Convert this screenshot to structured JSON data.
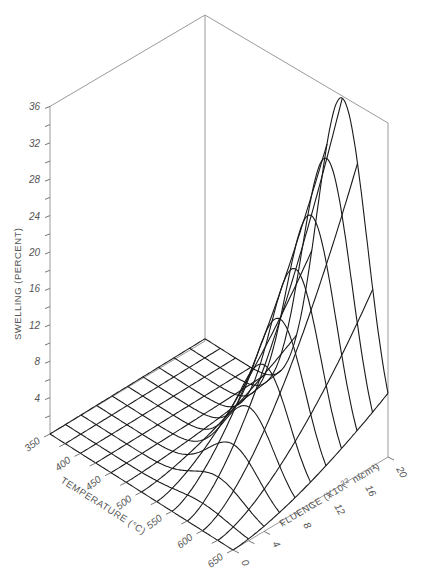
{
  "chart_data": {
    "type": "surface3d",
    "title": "",
    "zlabel": "SWELLING (PERCENT)",
    "xlabel": "TEMPERATURE (°C)",
    "ylabel": "FLUENCE (X10²² n/cm²)",
    "z_ticks": [
      4,
      8,
      12,
      16,
      20,
      24,
      28,
      32,
      36
    ],
    "z_range": [
      0,
      36
    ],
    "temperature_ticks": [
      350,
      400,
      450,
      500,
      550,
      600,
      650
    ],
    "temperature_range": [
      350,
      650
    ],
    "temperature_grid_step": 25,
    "fluence_ticks": [
      0,
      4,
      8,
      12,
      16,
      20
    ],
    "fluence_range": [
      0,
      20
    ],
    "fluence_grid_step": 2,
    "peak": {
      "temperature": 575,
      "fluence": 20,
      "swelling": 36
    },
    "model": {
      "peak_temperature": 575,
      "sigma": 58,
      "fluence_exponent": 1.6,
      "max_swelling": 36,
      "baseline": 0.25
    },
    "peak_swelling_by_fluence": {
      "fluence": [
        0,
        2,
        4,
        6,
        8,
        10,
        12,
        14,
        16,
        18,
        20
      ],
      "swelling": [
        0,
        0.9,
        2.7,
        5.2,
        8.2,
        11.8,
        15.8,
        20.3,
        25.1,
        30.4,
        36
      ]
    }
  },
  "labels": {
    "zlabel": "SWELLING (PERCENT)",
    "xlabel": "TEMPERATURE (°C)",
    "ylabel_main": "FLUENCE (X10",
    "ylabel_exp": "22",
    "ylabel_unit": " n/cm²)"
  }
}
